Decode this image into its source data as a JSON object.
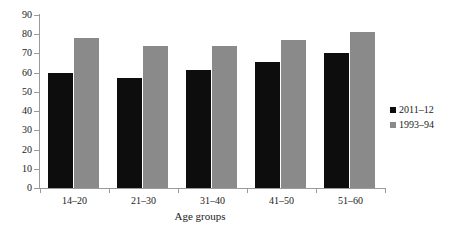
{
  "chart_data": {
    "type": "bar",
    "title": "",
    "subtitle": "",
    "xlabel": "Age groups",
    "ylabel": "",
    "categories": [
      "14–20",
      "21–30",
      "31–40",
      "41–50",
      "51–60"
    ],
    "series": [
      {
        "name": "2011–12",
        "color": "#0d0d0d",
        "values": [
          60,
          57,
          61.5,
          65.5,
          70
        ]
      },
      {
        "name": "1993–94",
        "color": "#8a8a8a",
        "values": [
          78,
          74,
          74,
          77,
          81
        ]
      }
    ],
    "ylim": [
      0,
      90
    ],
    "ytick_step": 10,
    "yticks": [
      0,
      10,
      20,
      30,
      40,
      50,
      60,
      70,
      80,
      90
    ],
    "ytick_labels": [
      "0",
      "10",
      "20",
      "30",
      "40",
      "50",
      "60",
      "70",
      "80",
      "90"
    ],
    "grid": false,
    "legend_position": "right"
  },
  "legend": {
    "entries": [
      {
        "label": "2011–12",
        "color": "#0d0d0d"
      },
      {
        "label": "1993–94",
        "color": "#8a8a8a"
      }
    ]
  },
  "colors": {
    "series_2011_12": "#0d0d0d",
    "series_1993_94": "#8a8a8a",
    "axis": "#9a9a9a",
    "text": "#1a1a1a",
    "background": "#ffffff"
  }
}
